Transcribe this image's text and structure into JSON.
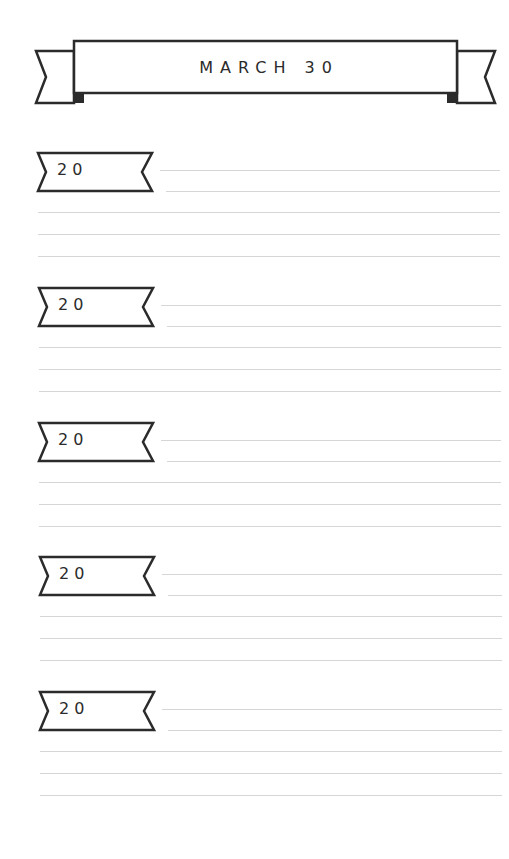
{
  "header": {
    "title": "MARCH 30"
  },
  "entries": [
    {
      "year_prefix": "20",
      "top": 151
    },
    {
      "year_prefix": "20",
      "top": 286
    },
    {
      "year_prefix": "20",
      "top": 421
    },
    {
      "year_prefix": "20",
      "top": 555
    },
    {
      "year_prefix": "20",
      "top": 690
    }
  ],
  "colors": {
    "ink": "#2b2b2b",
    "rule": "#d6d6d6",
    "paper": "#ffffff"
  }
}
